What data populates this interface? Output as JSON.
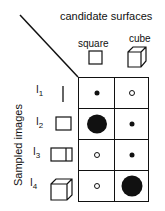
{
  "title": "candidate surfaces",
  "y_axis_label": "Sampled images",
  "columns": [
    {
      "label": "square",
      "icon": "square-icon"
    },
    {
      "label": "cube",
      "icon": "cube-icon"
    }
  ],
  "rows": [
    {
      "label": "I",
      "sub": "1",
      "icon": "line-icon",
      "cells": [
        "small-filled",
        "small-hollow"
      ]
    },
    {
      "label": "I",
      "sub": "2",
      "icon": "square-icon",
      "cells": [
        "large-filled",
        "small-filled"
      ]
    },
    {
      "label": "I",
      "sub": "3",
      "icon": "rect-panel-icon",
      "cells": [
        "small-hollow",
        "small-filled"
      ]
    },
    {
      "label": "I",
      "sub": "4",
      "icon": "cube-icon",
      "cells": [
        "small-hollow",
        "large-filled"
      ]
    }
  ]
}
